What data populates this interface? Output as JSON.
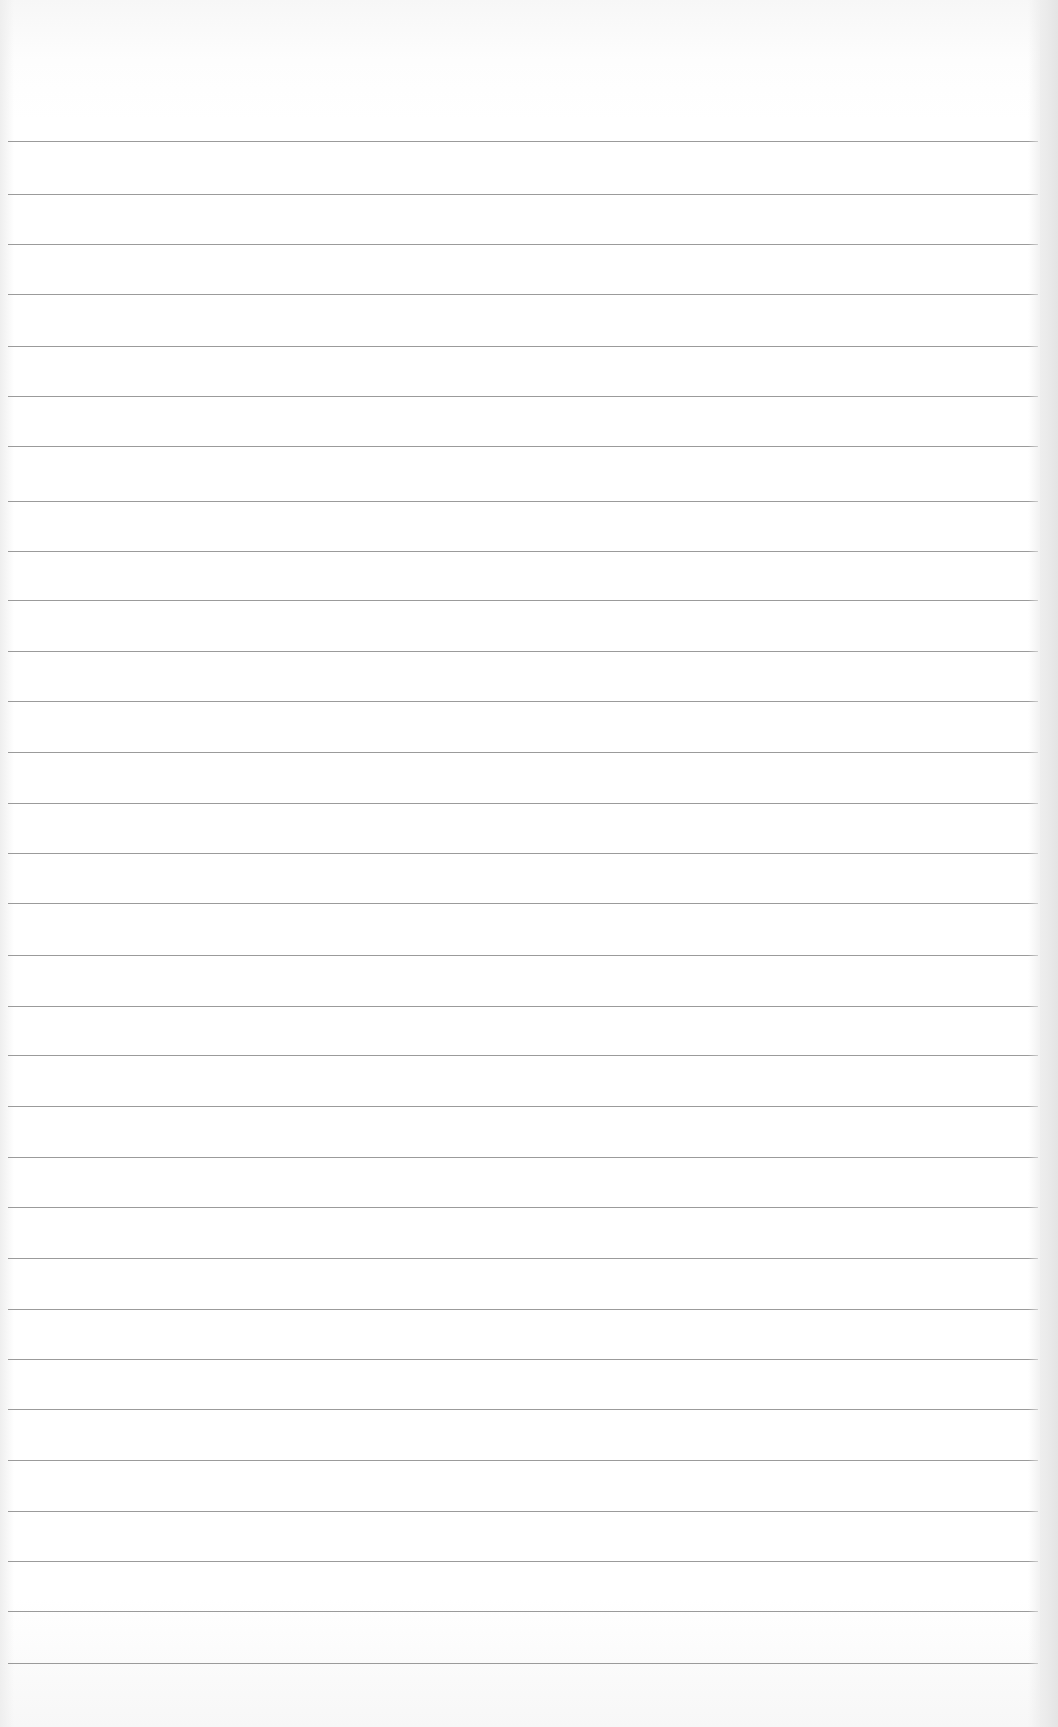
{
  "document": {
    "type": "lined-paper",
    "background_color": "#ffffff",
    "rule_color": "#8a8a8a",
    "rule_count": 31,
    "rule_positions_y": [
      141,
      194,
      244,
      294,
      346,
      396,
      446,
      501,
      551,
      600,
      651,
      701,
      752,
      803,
      853,
      903,
      955,
      1006,
      1055,
      1106,
      1157,
      1207,
      1258,
      1309,
      1359,
      1409,
      1460,
      1511,
      1561,
      1611,
      1663
    ]
  }
}
